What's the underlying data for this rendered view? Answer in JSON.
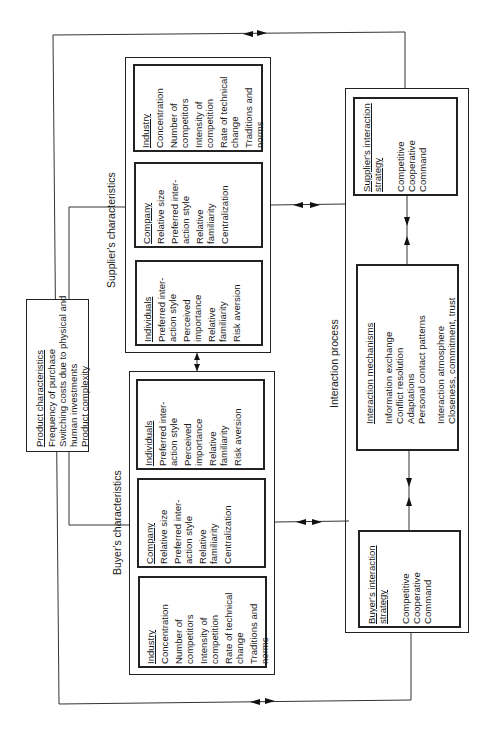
{
  "diagram": {
    "orientation": "rotated-90-ccw",
    "labels": {
      "supplier_characteristics": "Supplier's characteristics",
      "buyer_characteristics": "Buyer's characteristics",
      "interaction_process": "Interaction process"
    },
    "product_characteristics": {
      "title": "Product characteristics",
      "items": [
        "Frequency of purchase",
        "Switching costs due to physical and",
        "human investments",
        "Product complexity"
      ]
    },
    "supplier": {
      "industry": {
        "title": "Industry",
        "items": [
          "Concentration",
          "Number of",
          "competitors",
          "Intensity of",
          "competition",
          "Rate of technical",
          "change",
          "Traditions and",
          "norms"
        ]
      },
      "company": {
        "title": "Company",
        "items": [
          "Relative size",
          "Preferred inter-",
          "action style",
          "Relative",
          "familiarity",
          "Centralization"
        ]
      },
      "individuals": {
        "title": "Individuals",
        "items": [
          "Preferred inter-",
          "action style",
          "Perceived",
          "importance",
          "Relative",
          "familiarity",
          "Risk aversion"
        ]
      }
    },
    "buyer": {
      "individuals": {
        "title": "Individuals",
        "items": [
          "Preferred inter-",
          "action style",
          "Perceived",
          "importance",
          "Relative",
          "familiarity",
          "Risk aversion"
        ]
      },
      "company": {
        "title": "Company",
        "items": [
          "Relative size",
          "Preferred inter-",
          "action style",
          "Relative",
          "familiarity",
          "Centralization"
        ]
      },
      "industry": {
        "title": "Industry",
        "items": [
          "Concentration",
          "Number of",
          "competitors",
          "Intensity of",
          "competition",
          "Rate of technical",
          "change",
          "Traditions and",
          "norms"
        ]
      }
    },
    "supplier_strategy": {
      "title_line1": "Supplier's interaction",
      "title_line2": "strategy",
      "items": [
        "Competitive",
        "Cooperative",
        "Command"
      ]
    },
    "interaction_mechanisms": {
      "title": "Interaction mechanisms",
      "items": [
        "Information exchange",
        "Conflict resolution",
        "Adaptations",
        "Personal contact patterns"
      ],
      "atmosphere_title": "Interaction atmosphere",
      "atmosphere_items": [
        "Closeness, commitment, trust"
      ]
    },
    "buyer_strategy": {
      "title_line1": "Buyer's interaction",
      "title_line2": "strategy",
      "items": [
        "Competitive",
        "Cooperative",
        "Command"
      ]
    }
  }
}
